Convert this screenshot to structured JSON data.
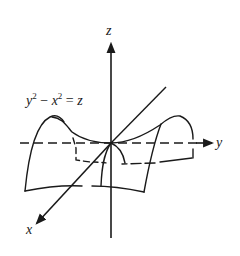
{
  "figure": {
    "type": "3d-surface-diagram",
    "surface": "hyperbolic paraboloid (saddle)",
    "equation": {
      "lhs_a": "y",
      "lhs_a_exp": "2",
      "minus": " − ",
      "lhs_b": "x",
      "lhs_b_exp": "2",
      "equals": " = ",
      "rhs": "z"
    },
    "axes": {
      "z": {
        "label": "z"
      },
      "y": {
        "label": "y"
      },
      "x": {
        "label": "x"
      }
    },
    "colors": {
      "ink": "#1a1a1a",
      "background": "#ffffff"
    }
  }
}
